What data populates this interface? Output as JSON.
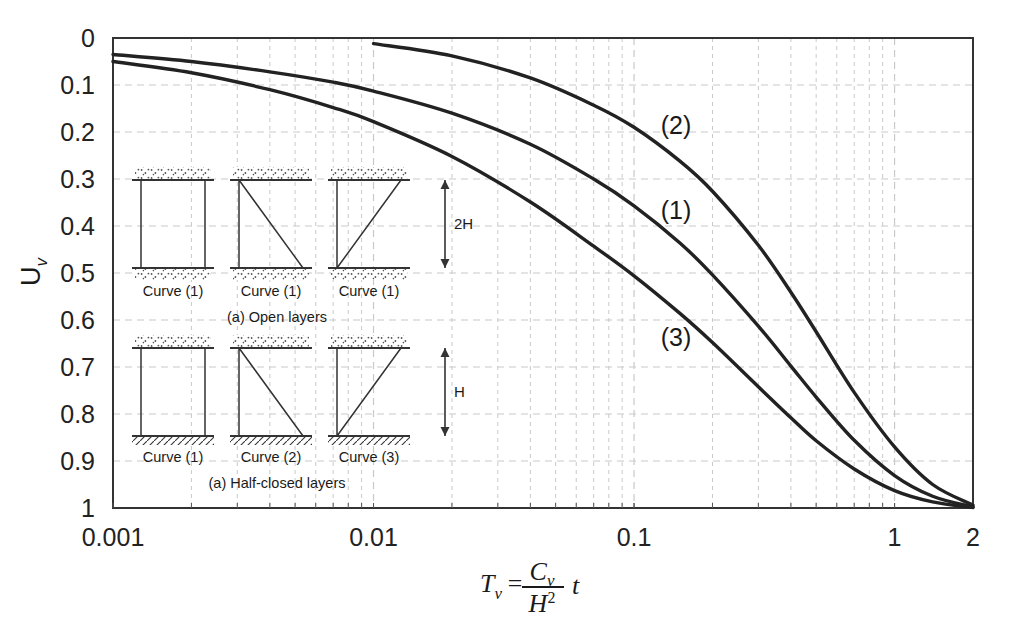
{
  "chart_data": {
    "type": "line",
    "title": "",
    "xlabel": "Tv = Cv / H^2 * t",
    "ylabel": "Uv",
    "xscale": "log",
    "xlim": [
      0.001,
      2
    ],
    "ylim": [
      0,
      1
    ],
    "y_inverted": true,
    "grid": true,
    "legend_position": "inline-annotations",
    "xticks": [
      "0.001",
      "0.01",
      "0.1",
      "1",
      "2"
    ],
    "xtick_values": [
      0.001,
      0.01,
      0.1,
      1,
      2
    ],
    "yticks": [
      "0",
      "0.1",
      "0.2",
      "0.3",
      "0.4",
      "0.5",
      "0.6",
      "0.7",
      "0.8",
      "0.9",
      "1"
    ],
    "ytick_values": [
      0,
      0.1,
      0.2,
      0.3,
      0.4,
      0.5,
      0.6,
      0.7,
      0.8,
      0.9,
      1
    ],
    "series": [
      {
        "name": "(1)",
        "label": "(1)",
        "color": "#222222",
        "x": [
          0.001,
          0.002,
          0.004,
          0.007,
          0.01,
          0.02,
          0.04,
          0.07,
          0.1,
          0.15,
          0.2,
          0.3,
          0.4,
          0.5,
          0.7,
          1.0,
          1.4,
          2.0
        ],
        "y": [
          0.035,
          0.05,
          0.072,
          0.094,
          0.113,
          0.16,
          0.226,
          0.3,
          0.357,
          0.436,
          0.504,
          0.613,
          0.698,
          0.764,
          0.856,
          0.931,
          0.975,
          0.998
        ]
      },
      {
        "name": "(2)",
        "label": "(2)",
        "color": "#222222",
        "x": [
          0.01,
          0.02,
          0.04,
          0.07,
          0.1,
          0.15,
          0.2,
          0.3,
          0.4,
          0.5,
          0.7,
          1.0,
          1.4,
          2.0
        ],
        "y": [
          0.012,
          0.038,
          0.085,
          0.143,
          0.19,
          0.262,
          0.326,
          0.441,
          0.541,
          0.625,
          0.754,
          0.87,
          0.95,
          0.994
        ]
      },
      {
        "name": "(3)",
        "label": "(3)",
        "color": "#222222",
        "x": [
          0.001,
          0.002,
          0.004,
          0.007,
          0.01,
          0.02,
          0.04,
          0.07,
          0.1,
          0.15,
          0.2,
          0.3,
          0.4,
          0.5,
          0.7,
          1.0,
          1.4,
          2.0
        ],
        "y": [
          0.05,
          0.074,
          0.11,
          0.148,
          0.178,
          0.252,
          0.349,
          0.443,
          0.506,
          0.586,
          0.648,
          0.742,
          0.808,
          0.857,
          0.917,
          0.963,
          0.987,
          0.999
        ]
      }
    ],
    "annotations": [
      {
        "text": "(2)",
        "x": 0.145,
        "y": 0.205
      },
      {
        "text": "(1)",
        "x": 0.145,
        "y": 0.385
      },
      {
        "text": "(3)",
        "x": 0.145,
        "y": 0.655
      }
    ]
  },
  "axes": {
    "y_label_main": "U",
    "y_label_sub": "v",
    "x_formula": {
      "lhs_main": "T",
      "lhs_sub": "v",
      "equals": "=",
      "num_main": "C",
      "num_sub": "v",
      "den_main": "H",
      "den_sup": "2",
      "tail": "t"
    }
  },
  "inset": {
    "group_a": {
      "caption": "(a) Open layers",
      "dimension_label": "2H",
      "panels": [
        {
          "label": "Curve (1)",
          "shape": "rectangle"
        },
        {
          "label": "Curve (1)",
          "shape": "right-triangle-down"
        },
        {
          "label": "Curve (1)",
          "shape": "right-triangle-up"
        }
      ]
    },
    "group_b": {
      "caption": "(a) Half-closed layers",
      "dimension_label": "H",
      "panels": [
        {
          "label": "Curve (1)",
          "shape": "rectangle"
        },
        {
          "label": "Curve (2)",
          "shape": "right-triangle-down"
        },
        {
          "label": "Curve (3)",
          "shape": "right-triangle-up"
        }
      ]
    }
  },
  "colors": {
    "curve": "#222222",
    "grid": "#c9c9c9",
    "frame": "#333333",
    "background": "#ffffff",
    "text": "#1a1a1a"
  }
}
